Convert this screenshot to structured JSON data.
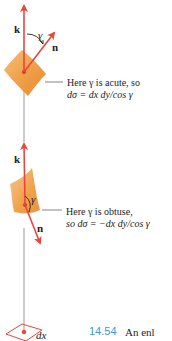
{
  "figure": {
    "number": "14.54",
    "caption_start": "An enl",
    "colors": {
      "vector": "#e8463a",
      "surface": "#f0a04a",
      "axis_line": "#999999",
      "base_patch": "#e8463a",
      "caption_number": "#3d9ad6",
      "text": "#222222"
    },
    "top_case": {
      "k_label": "k",
      "n_label": "n",
      "angle_label": "γ",
      "note_line1": "Here γ is acute, so",
      "note_line2": "dσ = dx dy/cos γ"
    },
    "bottom_case": {
      "k_label": "k",
      "n_label": "n",
      "angle_label": "γ",
      "note_line1": "Here γ is obtuse,",
      "note_line2": "so dσ = −dx dy/cos γ"
    },
    "base": {
      "dx_label": "dx"
    }
  }
}
